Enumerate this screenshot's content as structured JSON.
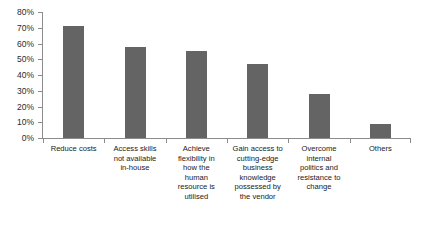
{
  "chart_data": {
    "type": "bar",
    "title": "",
    "subtitle": "",
    "xlabel": "",
    "ylabel": "",
    "ylim": [
      0,
      80
    ],
    "grid": false,
    "legend": null,
    "legend_position": "none",
    "bar_color": "#646464",
    "axis_color": "#8c8c8c",
    "text_color": "#1a1a1a",
    "categories": [
      "Reduce costs",
      "Access skills not available in-house",
      "Achieve flexibility in how the human resource is utilised",
      "Gain access to cutting-edge business knowledge possessed by the vendor",
      "Overcome internal politics and resistance to change",
      "Others"
    ],
    "category_lines": [
      "Reduce costs",
      "Access skills\nnot available\nin-house",
      "Achieve\nflexibility in\nhow the\nhuman\nresource is\nutilised",
      "Gain access to\ncutting-edge\nbusiness\nknowledge\npossessed by\nthe vendor",
      "Overcome\ninternal\npolitics and\nresistance to\nchange",
      "Others"
    ],
    "values": [
      71,
      58,
      55,
      47,
      28,
      9
    ],
    "value_unit": "%",
    "ytick_values": [
      0,
      10,
      20,
      30,
      40,
      50,
      60,
      70,
      80
    ],
    "ytick_labels": [
      "0%",
      "10%",
      "20%",
      "30%",
      "40%",
      "50%",
      "60%",
      "70%",
      "80%"
    ]
  }
}
